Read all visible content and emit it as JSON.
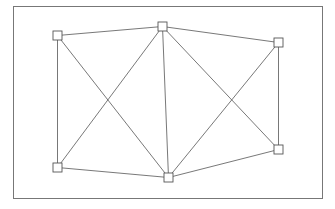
{
  "diagram": {
    "type": "graph",
    "frame": {
      "x": 13.5,
      "y": 6.5,
      "width": 309,
      "height": 192,
      "stroke": "#777777"
    },
    "style": {
      "edge_color": "#555555",
      "node_stroke": "#555555",
      "node_fill": "#ffffff",
      "node_size": 9
    },
    "nodes": [
      {
        "id": "top-left",
        "x": 57.5,
        "y": 35.5
      },
      {
        "id": "top-center",
        "x": 162.5,
        "y": 26.5
      },
      {
        "id": "top-right",
        "x": 278.5,
        "y": 42.5
      },
      {
        "id": "bottom-right",
        "x": 278.5,
        "y": 149.5
      },
      {
        "id": "bottom-center",
        "x": 168.5,
        "y": 177.5
      },
      {
        "id": "bottom-left",
        "x": 57.5,
        "y": 167.5
      }
    ],
    "edges": [
      [
        "top-left",
        "top-center"
      ],
      [
        "top-center",
        "top-right"
      ],
      [
        "top-right",
        "bottom-right"
      ],
      [
        "bottom-right",
        "bottom-center"
      ],
      [
        "bottom-center",
        "bottom-left"
      ],
      [
        "bottom-left",
        "top-left"
      ],
      [
        "top-left",
        "bottom-center"
      ],
      [
        "bottom-left",
        "top-center"
      ],
      [
        "top-center",
        "bottom-center"
      ],
      [
        "top-center",
        "bottom-right"
      ],
      [
        "bottom-center",
        "top-right"
      ]
    ]
  }
}
